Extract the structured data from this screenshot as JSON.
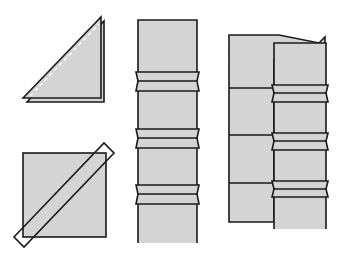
{
  "diagram": {
    "title": "",
    "colors": {
      "background": "#ffffff",
      "fill": "#d4d4d4",
      "stroke": "#1a1a1a",
      "dash": "#ffffff"
    },
    "panels": [
      {
        "id": "folded-triangle",
        "description": "Square folded diagonally into a triangle with stitch line"
      },
      {
        "id": "square-cut-diagonal",
        "description": "Square with diagonal cut line extended at corners"
      },
      {
        "id": "long-strip-seams",
        "description": "Vertical strip with three joined seam bands"
      },
      {
        "id": "strip-on-panel",
        "description": "Seamed strip overlaid on a wider background panel"
      }
    ]
  }
}
